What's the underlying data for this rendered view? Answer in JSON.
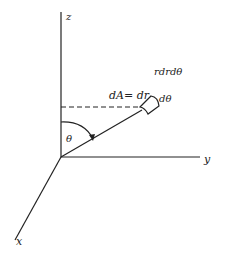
{
  "diagram": {
    "title": "",
    "axes": {
      "z_label": "z",
      "y_label": "y",
      "x_label": "x"
    },
    "labels": {
      "element_area": "rdrdθ",
      "dA": "dA= dr",
      "dtheta": "dθ",
      "theta": "θ"
    },
    "colors": {
      "ink": "#222222",
      "background": "#ffffff"
    }
  }
}
